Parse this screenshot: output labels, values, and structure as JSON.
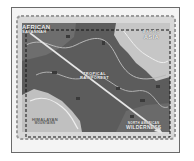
{
  "map": {
    "regions": [
      {
        "id": "african-savannah",
        "line1": "AFRICAN",
        "line2": "SAVANNAH"
      },
      {
        "id": "exotic-asia",
        "line1": "EXOTIC",
        "line2": "ASIA"
      },
      {
        "id": "tropical-rainforest",
        "line1": "TROPICAL",
        "line2": "RAINFOREST"
      },
      {
        "id": "himalayan-mountains",
        "line1": "HIMALAYAN",
        "line2": "MOUNTAINS"
      },
      {
        "id": "north-american-wilderness",
        "line1": "NORTH AMERICAN",
        "line2": "WILDERNESS"
      }
    ],
    "route": {
      "from": "african-savannah",
      "to": "north-american-wilderness",
      "icon": "arrow-icon"
    },
    "colors": {
      "dark_terrain": "#5a5a5a",
      "mid_terrain": "#7a7a7a",
      "light_terrain": "#c4c4c4",
      "paths": "#bdbdbd",
      "frame_border": "#6a6a6a",
      "frame_bg": "#f4f4f4"
    }
  }
}
